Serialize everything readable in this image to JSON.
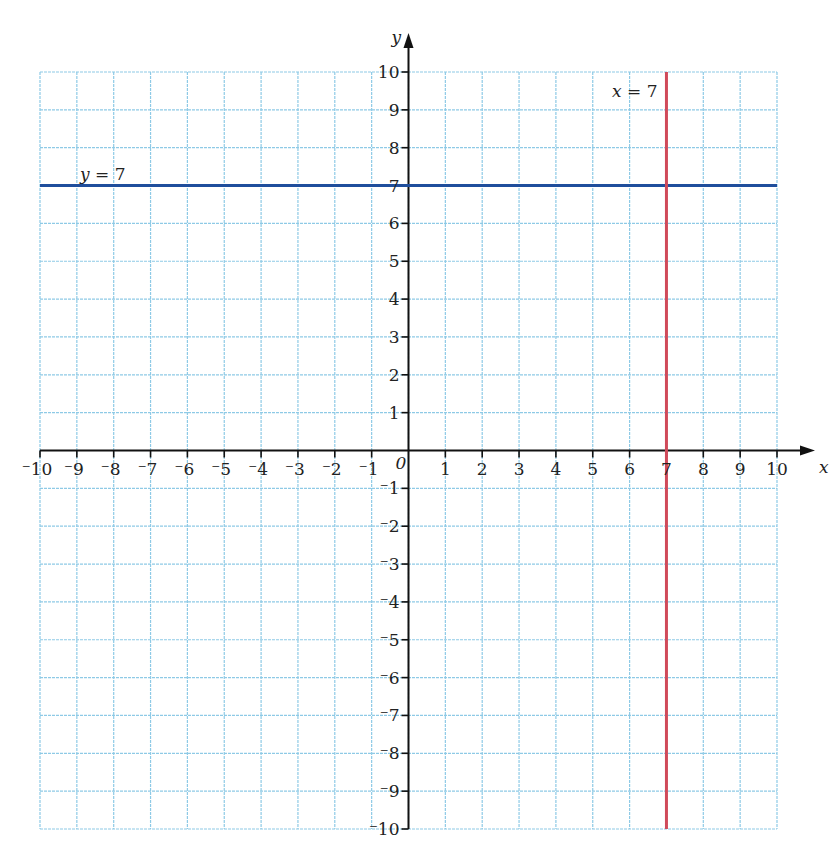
{
  "chart_data": {
    "type": "line",
    "title": "",
    "xlabel": "x",
    "ylabel": "y",
    "xlim": [
      -10,
      10
    ],
    "ylim": [
      -10,
      10
    ],
    "grid": true,
    "x_ticks": [
      -10,
      -9,
      -8,
      -7,
      -6,
      -5,
      -4,
      -3,
      -2,
      -1,
      1,
      2,
      3,
      4,
      5,
      6,
      7,
      8,
      9,
      10
    ],
    "y_ticks": [
      -10,
      -9,
      -8,
      -7,
      -6,
      -5,
      -4,
      -3,
      -2,
      -1,
      1,
      2,
      3,
      4,
      5,
      6,
      7,
      8,
      9,
      10
    ],
    "origin_label": "0",
    "series": [
      {
        "name": "y = 7",
        "kind": "horizontal",
        "value": 7,
        "color": "#1f4e9c",
        "x": [
          -10,
          10
        ],
        "y": [
          7,
          7
        ]
      },
      {
        "name": "x = 7",
        "kind": "vertical",
        "value": 7,
        "color": "#d04a5a",
        "x": [
          7,
          7
        ],
        "y": [
          -10,
          10
        ]
      }
    ],
    "annotations": [
      {
        "text": "y = 7",
        "near": [
          -9,
          7.2
        ]
      },
      {
        "text": "x = 7",
        "near": [
          6.1,
          9.5
        ]
      }
    ]
  },
  "colors": {
    "grid": "#8ecae6",
    "axis": "#111111"
  }
}
